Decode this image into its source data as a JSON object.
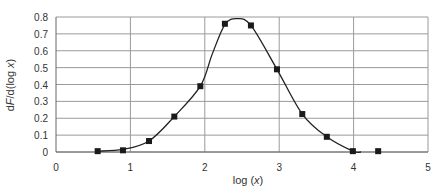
{
  "chart_data": {
    "type": "line",
    "title": "",
    "xlabel": "log (x)",
    "ylabel": "dF/d(log x)",
    "xlim": [
      0,
      5
    ],
    "ylim": [
      0,
      0.8
    ],
    "x_ticks": [
      "0",
      "1",
      "2",
      "3",
      "4",
      "5"
    ],
    "y_ticks": [
      "0",
      "0.1",
      "0.2",
      "0.3",
      "0.4",
      "0.5",
      "0.6",
      "0.7",
      "0.8"
    ],
    "grid": {
      "horizontal": true,
      "vertical": true
    },
    "legend": null,
    "series": [
      {
        "name": "data points",
        "style": "square-markers",
        "x": [
          0.56,
          0.9,
          1.25,
          1.59,
          1.94,
          2.27,
          2.62,
          2.97,
          3.31,
          3.64,
          3.99,
          4.33
        ],
        "y": [
          0.005,
          0.01,
          0.065,
          0.21,
          0.39,
          0.76,
          0.75,
          0.49,
          0.225,
          0.09,
          0.005,
          0.005
        ]
      },
      {
        "name": "fitted curve",
        "style": "smooth-line",
        "x": [
          0.56,
          0.9,
          1.25,
          1.59,
          1.94,
          2.1,
          2.27,
          2.43,
          2.62,
          2.97,
          3.31,
          3.64,
          3.99,
          4.1
        ],
        "y": [
          0.005,
          0.015,
          0.065,
          0.21,
          0.39,
          0.58,
          0.755,
          0.79,
          0.75,
          0.49,
          0.225,
          0.09,
          0.005,
          0.0
        ]
      }
    ]
  }
}
